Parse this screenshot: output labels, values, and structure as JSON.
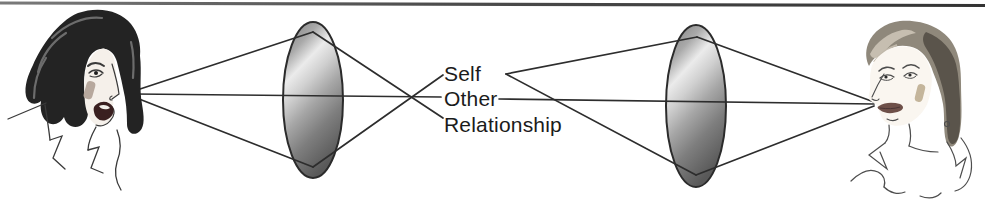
{
  "diagram": {
    "labels": {
      "self": "Self",
      "other": "Other",
      "relationship": "Relationship"
    },
    "figures": {
      "left": "woman-facing-right-illustration",
      "right": "woman-facing-left-illustration"
    },
    "lenses": {
      "count": 2,
      "shape": "convex-lens-ellipse"
    },
    "colors": {
      "background": "#ffffff",
      "ray_line": "#2d2d2d",
      "label_text": "#1b1b1b",
      "top_rule": "#4c4c4c",
      "lens_light": "#ebebeb",
      "lens_dark": "#595959",
      "lens_stroke": "#2b2b2b",
      "left_hair": "#232323",
      "right_hair": "#8f887b",
      "blush": "#c3b49e"
    }
  }
}
